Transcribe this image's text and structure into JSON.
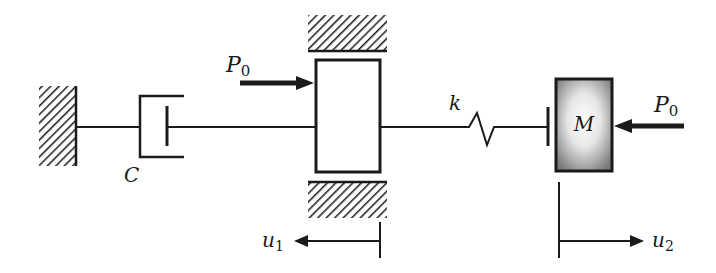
{
  "diagram": {
    "colors": {
      "ink": "#1a1a1a",
      "mass_edge": "#7a7a7a",
      "mass_center": "#ffffff",
      "background": "#ffffff"
    },
    "labels": {
      "damper": "C",
      "spring": "k",
      "mass": "M",
      "force_left_main": "P",
      "force_left_sub": "0",
      "force_right_main": "P",
      "force_right_sub": "0",
      "disp1_main": "u",
      "disp1_sub": "1",
      "disp2_main": "u",
      "disp2_sub": "2"
    },
    "components": [
      {
        "id": "fixed-wall",
        "type": "ground-support"
      },
      {
        "id": "damper",
        "type": "dashpot",
        "label_ref": "damper"
      },
      {
        "id": "block",
        "type": "rigid-block-guided"
      },
      {
        "id": "guide-top",
        "type": "ground-support"
      },
      {
        "id": "guide-bottom",
        "type": "ground-support"
      },
      {
        "id": "spring",
        "type": "spring",
        "label_ref": "spring"
      },
      {
        "id": "gap-plate",
        "type": "contact-plate"
      },
      {
        "id": "mass",
        "type": "mass",
        "label_ref": "mass"
      },
      {
        "id": "force-on-block",
        "type": "force",
        "direction": "right"
      },
      {
        "id": "force-on-mass",
        "type": "force",
        "direction": "left"
      },
      {
        "id": "displacement-u1",
        "type": "displacement",
        "direction": "left"
      },
      {
        "id": "displacement-u2",
        "type": "displacement",
        "direction": "right"
      }
    ]
  }
}
